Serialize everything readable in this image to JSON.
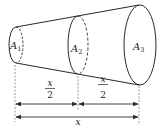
{
  "diagram": {
    "type": "frustum-cross-sections",
    "sections": [
      {
        "label": "A",
        "subscript": "1"
      },
      {
        "label": "A",
        "subscript": "2"
      },
      {
        "label": "A",
        "subscript": "3"
      }
    ],
    "dimensions": {
      "segment1": {
        "numerator": "x",
        "denominator": "2"
      },
      "segment2": {
        "numerator": "x",
        "denominator": "2"
      },
      "total": "x"
    },
    "colors": {
      "stroke": "#2a2a2a",
      "background": "#ffffff"
    }
  }
}
